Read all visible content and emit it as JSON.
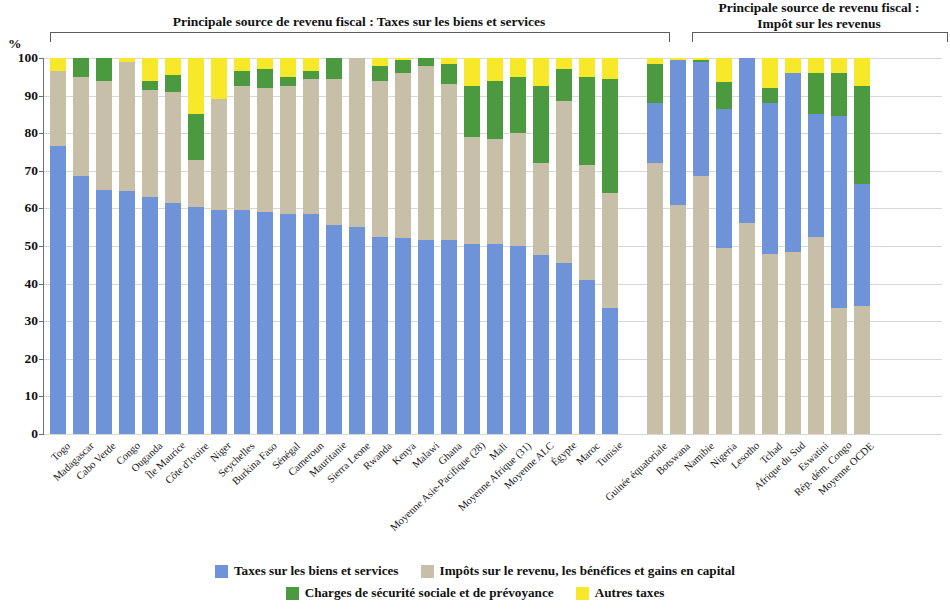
{
  "headers": {
    "left": "Principale source de revenu fiscal : Taxes sur les biens et services",
    "right_line1": "Principale source de revenu fiscal :",
    "right_line2": "Impôt sur les revenus"
  },
  "axis": {
    "unit": "%",
    "ticks": [
      "100",
      "90",
      "80",
      "70",
      "60",
      "50",
      "40",
      "30",
      "20",
      "10",
      "0"
    ]
  },
  "legend": {
    "items": [
      {
        "label": "Taxes sur les biens et services",
        "color": "#6e93d8"
      },
      {
        "label": "Impôts sur le revenu, les bénéfices et gains en capital",
        "color": "#c7bfa8"
      },
      {
        "label": "Charges de sécurité sociale et de prévoyance",
        "color": "#4c9a3f"
      },
      {
        "label": "Autres taxes",
        "color": "#f7e92a"
      }
    ]
  },
  "chart_data": {
    "type": "bar",
    "subtype": "stacked-100",
    "title": "Principale source de revenu fiscal",
    "xlabel": "",
    "ylabel": "%",
    "ylim": [
      0,
      100
    ],
    "grid": true,
    "legend_position": "bottom",
    "series": [
      {
        "name": "Taxes sur les biens et services",
        "color": "#6e93d8"
      },
      {
        "name": "Impôts sur le revenu, les bénéfices et gains en capital",
        "color": "#c7bfa8"
      },
      {
        "name": "Charges de sécurité sociale et de prévoyance",
        "color": "#4c9a3f"
      },
      {
        "name": "Autres taxes",
        "color": "#f7e92a"
      }
    ],
    "groups": [
      {
        "name": "Principale source de revenu fiscal : Taxes sur les biens et services",
        "stack_order": [
          "Taxes sur les biens et services",
          "Impôts sur le revenu, les bénéfices et gains en capital",
          "Charges de sécurité sociale et de prévoyance",
          "Autres taxes"
        ],
        "categories": [
          "Togo",
          "Madagascar",
          "Cabo Verde",
          "Congo",
          "Ouganda",
          "Île Maurice",
          "Côte d'Ivoire",
          "Niger",
          "Seychelles",
          "Burkina Faso",
          "Sénégal",
          "Cameroun",
          "Mauritanie",
          "Sierra Leone",
          "Rwanda",
          "Kenya",
          "Malawi",
          "Ghana",
          "Moyenne Asie-Pacifique (28)",
          "Mali",
          "Moyenne Afrique (31)",
          "Moyenne ALC",
          "Égypte",
          "Maroc",
          "Tunisie"
        ],
        "values": {
          "Taxes sur les biens et services": [
            76.5,
            68.5,
            65.0,
            64.5,
            63.0,
            61.5,
            60.5,
            59.5,
            59.5,
            59.0,
            58.5,
            58.5,
            55.5,
            55.0,
            52.5,
            52.0,
            51.5,
            51.5,
            50.5,
            50.5,
            50.0,
            47.5,
            45.5,
            41.0,
            33.5
          ],
          "Impôts sur le revenu, les bénéfices et gains en capital": [
            20.0,
            26.5,
            29.0,
            34.5,
            28.5,
            29.5,
            12.5,
            29.5,
            33.0,
            33.0,
            34.0,
            36.0,
            39.0,
            45.0,
            41.5,
            44.0,
            46.5,
            41.5,
            28.5,
            28.0,
            30.0,
            24.5,
            43.0,
            30.5,
            30.5
          ],
          "Charges de sécurité sociale et de prévoyance": [
            0.0,
            5.0,
            6.0,
            0.0,
            2.5,
            4.5,
            12.0,
            0.0,
            4.0,
            5.0,
            2.5,
            2.0,
            5.5,
            0.0,
            4.0,
            3.5,
            2.0,
            5.5,
            13.5,
            15.5,
            15.0,
            20.5,
            8.5,
            23.5,
            30.5
          ],
          "Autres taxes": [
            3.5,
            0.0,
            0.0,
            1.0,
            6.0,
            4.5,
            15.0,
            11.0,
            3.5,
            3.0,
            5.0,
            3.5,
            0.0,
            0.0,
            2.0,
            0.5,
            0.0,
            1.5,
            7.5,
            6.0,
            5.0,
            7.5,
            3.0,
            5.0,
            5.5
          ]
        }
      },
      {
        "name": "Principale source de revenu fiscal : Impôt sur les revenus",
        "stack_order": [
          "Impôts sur le revenu, les bénéfices et gains en capital",
          "Taxes sur les biens et services",
          "Charges de sécurité sociale et de prévoyance",
          "Autres taxes"
        ],
        "categories": [
          "Guinée équatoriale",
          "Botswana",
          "Namibie",
          "Nigeria",
          "Lesotho",
          "Tchad",
          "Afrique du Sud",
          "Eswatini",
          "Rép. dém. Congo",
          "Moyenne OCDE"
        ],
        "values": {
          "Impôts sur le revenu, les bénéfices et gains en capital": [
            72.0,
            61.0,
            68.5,
            49.5,
            56.0,
            48.0,
            48.5,
            52.5,
            33.5,
            34.0
          ],
          "Taxes sur les biens et services": [
            16.0,
            38.5,
            30.5,
            37.0,
            44.0,
            40.0,
            47.5,
            32.5,
            51.0,
            32.5
          ],
          "Charges de sécurité sociale et de prévoyance": [
            10.5,
            0.0,
            0.5,
            7.0,
            0.0,
            4.0,
            0.0,
            11.0,
            11.5,
            26.0
          ],
          "Autres taxes": [
            1.5,
            0.5,
            0.5,
            6.5,
            0.0,
            8.0,
            4.0,
            4.0,
            4.0,
            7.5
          ]
        }
      }
    ]
  }
}
